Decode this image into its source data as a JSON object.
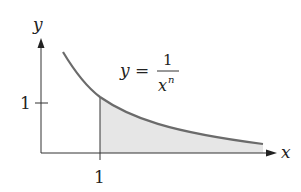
{
  "diagram": {
    "axes": {
      "x_label": "x",
      "y_label": "y",
      "x_tick_label": "1",
      "y_tick_label": "1"
    },
    "equation": {
      "lhs": "y",
      "equals": "=",
      "numerator": "1",
      "denominator_base": "x",
      "denominator_exponent": "n"
    },
    "colors": {
      "axis": "#333333",
      "curve": "#6b6b6b",
      "shaded_region": "#e6e6e6"
    },
    "shaded_region": "area under curve from x = 1 to infinity"
  }
}
